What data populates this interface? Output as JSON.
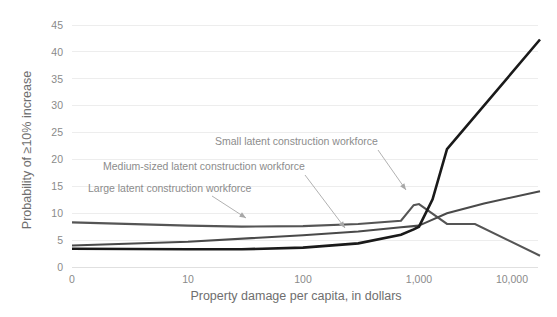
{
  "chart_data": {
    "type": "line",
    "title": "",
    "subtitle": "",
    "xlabel": "Property damage per capita, in dollars",
    "ylabel": "Probability of ≥10% increase",
    "x_scale": "log",
    "x_tick_labels": [
      "0",
      "10",
      "100",
      "1,000",
      "10,000"
    ],
    "x_tick_values": [
      0,
      10,
      100,
      1000,
      10000
    ],
    "xlim": [
      0,
      20000
    ],
    "y_tick_labels": [
      "0",
      "5",
      "10",
      "15",
      "20",
      "25",
      "30",
      "35",
      "40",
      "45"
    ],
    "y_tick_values": [
      0,
      5,
      10,
      15,
      20,
      25,
      30,
      35,
      40,
      45
    ],
    "ylim": [
      0,
      45
    ],
    "grid": "horizontal",
    "legend": "annotations-inline",
    "series": [
      {
        "name": "Small latent construction workforce",
        "color": "#555555",
        "stroke_width": 2.1,
        "x": [
          0,
          10,
          30,
          100,
          300,
          700,
          900,
          1000,
          2000,
          4000,
          20000
        ],
        "values": [
          8.3,
          7.7,
          7.5,
          7.6,
          8.0,
          8.6,
          11.5,
          11.7,
          8.0,
          8.0,
          2.1
        ]
      },
      {
        "name": "Medium-sized latent construction workforce",
        "color": "#4a4a4a",
        "stroke_width": 2.1,
        "x": [
          0,
          10,
          100,
          300,
          700,
          900,
          1000,
          2000,
          5000,
          20000
        ],
        "values": [
          4.0,
          4.7,
          5.9,
          6.6,
          7.4,
          7.6,
          7.7,
          10.0,
          11.8,
          14.1
        ]
      },
      {
        "name": "Large latent construction workforce",
        "color": "#1a1a1a",
        "stroke_width": 2.6,
        "x": [
          0,
          10,
          30,
          100,
          300,
          700,
          900,
          1000,
          1400,
          2000,
          20000
        ],
        "values": [
          3.4,
          3.3,
          3.3,
          3.6,
          4.4,
          6.0,
          7.0,
          7.5,
          12.6,
          21.9,
          42.3
        ]
      }
    ],
    "annotations": [
      {
        "name": "small-latent-annotation",
        "text": "Small latent construction workforce",
        "text_x": 215,
        "text_y": 145,
        "anchor": "start",
        "leader_from": [
          378,
          150
        ],
        "leader_to": [
          406,
          190
        ]
      },
      {
        "name": "medium-latent-annotation",
        "text": "Medium-sized latent construction workforce",
        "text_x": 103,
        "text_y": 170,
        "anchor": "start",
        "leader_from": [
          305,
          175
        ],
        "leader_to": [
          345,
          228
        ]
      },
      {
        "name": "large-latent-annotation",
        "text": "Large latent construction workforce",
        "text_x": 88,
        "text_y": 192,
        "anchor": "start",
        "leader_from": [
          212,
          196
        ],
        "leader_to": [
          246,
          218
        ]
      }
    ]
  },
  "axes": {
    "y_title": "Probability of ≥10% increase",
    "x_title": "Property damage per capita, in dollars"
  },
  "ticks": {
    "y": [
      "45",
      "40",
      "35",
      "30",
      "25",
      "20",
      "15",
      "10",
      "5",
      "0"
    ],
    "x": [
      "0",
      "10",
      "100",
      "1,000",
      "10,000"
    ]
  },
  "annotations": {
    "small": "Small latent construction workforce",
    "medium": "Medium-sized latent construction workforce",
    "large": "Large latent construction workforce"
  },
  "colors": {
    "background": "#ffffff",
    "grid": "#ededed",
    "tick_text": "#8a8a8a",
    "axis_title": "#6e6e6e",
    "annotation_text": "#8c8c8c",
    "series_small": "#555555",
    "series_medium": "#4a4a4a",
    "series_large": "#1a1a1a"
  }
}
